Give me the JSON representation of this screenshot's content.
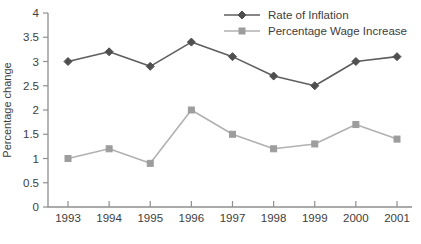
{
  "chart": {
    "background": "#ffffff",
    "text_color": "#3d3d3d",
    "axis_color": "#8f8f8f"
  },
  "chart_data": {
    "type": "line",
    "title": "",
    "xlabel": "",
    "ylabel": "Percentage change",
    "categories": [
      "1993",
      "1994",
      "1995",
      "1996",
      "1997",
      "1998",
      "1999",
      "2000",
      "2001"
    ],
    "series": [
      {
        "name": "Rate of Inflation",
        "values": [
          3.0,
          3.2,
          2.9,
          3.4,
          3.1,
          2.7,
          2.5,
          3.0,
          3.1
        ],
        "color": "#5e5e5e",
        "marker": "diamond",
        "marker_color": "#4f4f4f"
      },
      {
        "name": "Percentage Wage Increase",
        "values": [
          1.0,
          1.2,
          0.9,
          2.0,
          1.5,
          1.2,
          1.3,
          1.7,
          1.4
        ],
        "color": "#b1b1b1",
        "marker": "square",
        "marker_color": "#9d9d9d"
      }
    ],
    "ylim": [
      0,
      4
    ],
    "ytick_step": 0.5,
    "grid": false,
    "legend_position": "top-right-inside"
  }
}
